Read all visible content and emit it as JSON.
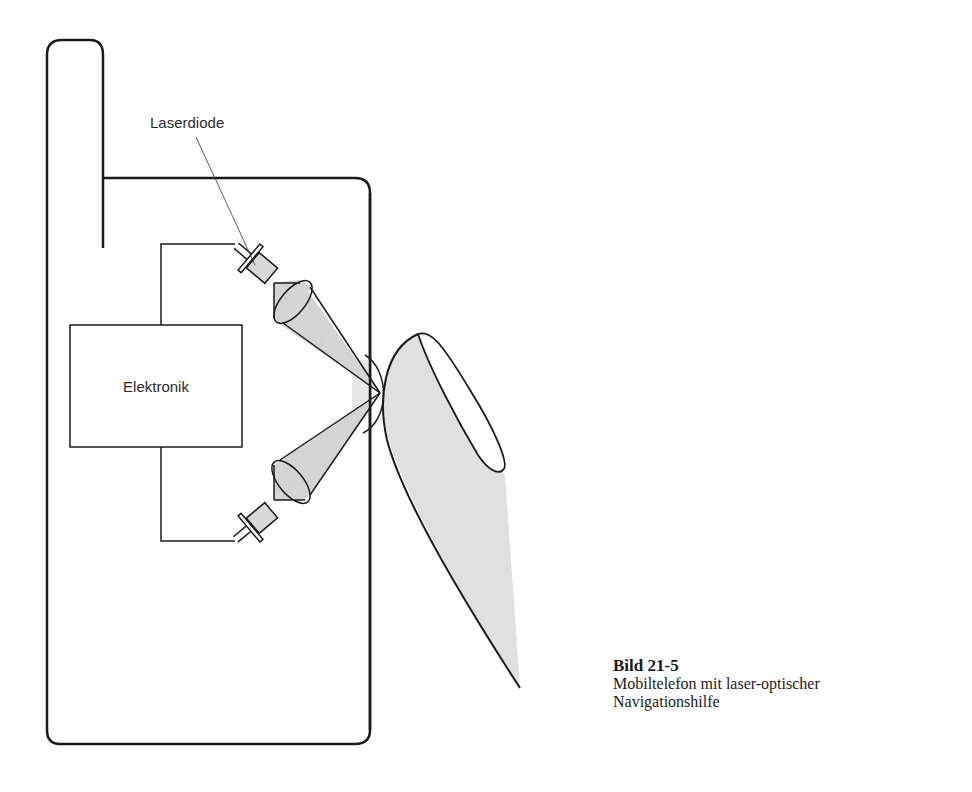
{
  "diagram": {
    "labels": {
      "laser_diode": "Laserdiode",
      "electronics": "Elektronik"
    },
    "components": [
      "phone-housing",
      "antenna",
      "electronics-box",
      "laser-diode-top",
      "laser-diode-bottom",
      "lens-top",
      "lens-bottom",
      "beam-top",
      "beam-bottom",
      "focal-lens",
      "finger"
    ],
    "colors": {
      "line": "#1a1a1a",
      "fill_gray": "#d4d4d4",
      "finger_fill": "#e0e0e0",
      "background": "#ffffff"
    }
  },
  "caption": {
    "title": "Bild 21-5",
    "line1": "Mobiltelefon mit laser-optischer",
    "line2": "Navigationshilfe"
  }
}
